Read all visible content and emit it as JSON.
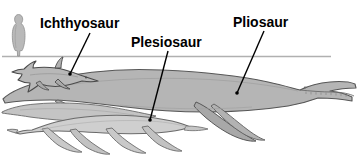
{
  "figure": {
    "background_color": "#ffffff",
    "line_color": "#000000",
    "waterline": {
      "name": "waterline",
      "color": "#b0b0b0",
      "y": 56,
      "x_start": 2,
      "x_end": 331
    },
    "scale_figure": {
      "name": "human-scale-silhouette",
      "fill": "#b9b9b9",
      "stroke": "#8a8a8a"
    }
  },
  "labels": [
    {
      "id": "ichthyosaur",
      "text": "Ichthyosaur",
      "x": 40,
      "y": 28,
      "anchor": "start",
      "leader": {
        "x1": 90,
        "y1": 33,
        "x2": 70,
        "y2": 74
      }
    },
    {
      "id": "plesiosaur",
      "text": "Plesiosaur",
      "x": 131,
      "y": 47,
      "anchor": "start",
      "leader": {
        "x1": 168,
        "y1": 51,
        "x2": 150,
        "y2": 120
      }
    },
    {
      "id": "pliosaur",
      "text": "Pliosaur",
      "x": 233,
      "y": 27,
      "anchor": "start",
      "leader": {
        "x1": 264,
        "y1": 31,
        "x2": 237,
        "y2": 93
      }
    }
  ],
  "creatures": [
    {
      "id": "ichthyosaur",
      "name": "Ichthyosaur",
      "fill": "#b8b8b8",
      "stroke": "#4a4a4a",
      "description": "dolphin-shaped marine reptile with pointed snout, dorsal fin and crescent tail"
    },
    {
      "id": "plesiosaur",
      "name": "Plesiosaur",
      "fill": "#cfcfcf",
      "stroke": "#6a6a6a",
      "description": "long-necked marine reptile with small head, broad body and four large flippers"
    },
    {
      "id": "pliosaur",
      "name": "Pliosaur",
      "fill": "#b5b5b5",
      "stroke": "#5a5a5a",
      "description": "large short-necked marine reptile with massive toothed jaws and paddle flippers"
    },
    {
      "id": "plesiosaur-back",
      "name": "Plesiosaur (rear individual)",
      "fill": "#c4c4c4",
      "stroke": "#6a6a6a",
      "description": "second long-necked plesiosaur body behind the foreground one"
    }
  ]
}
